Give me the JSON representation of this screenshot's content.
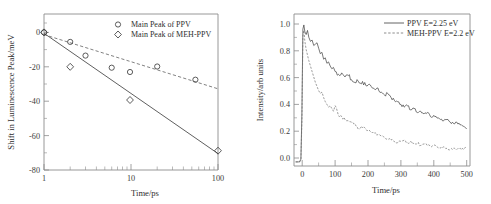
{
  "figure": {
    "background": "#ffffff",
    "panel_count": 2
  },
  "chart_data": [
    {
      "id": "left",
      "type": "scatter",
      "title": "",
      "xlabel": "Time/ps",
      "ylabel": "Shift in Luminescence Peak/meV",
      "xscale": "log",
      "yscale": "linear",
      "xlim": [
        1,
        100
      ],
      "ylim": [
        -80,
        5
      ],
      "xticks": [
        1,
        10,
        100
      ],
      "xticklabels": [
        "1",
        "10",
        "100"
      ],
      "yticks": [
        0,
        -20,
        -40,
        -60,
        -80
      ],
      "yticklabels": [
        "0",
        "-20",
        "-40",
        "-60",
        "-80"
      ],
      "grid": false,
      "legend_position": "top-right",
      "series": [
        {
          "name": "Main Peak of PPV",
          "marker": "circle",
          "linestyle": "dashed",
          "color": "#3f3f3f",
          "x": [
            1,
            2,
            3,
            6,
            11,
            20,
            47
          ],
          "y": [
            0,
            -5.5,
            -13.5,
            -20.5,
            -23.0,
            -19.8,
            -27.5
          ],
          "fit_x": [
            1,
            100
          ],
          "fit_y": [
            -1.5,
            -33.0
          ]
        },
        {
          "name": "Main Peak of MEH-PPV",
          "marker": "diamond",
          "linestyle": "solid",
          "color": "#3f3f3f",
          "x": [
            1,
            2,
            11,
            100
          ],
          "y": [
            0,
            -20.0,
            -39.5,
            -69.0
          ],
          "fit_x": [
            1,
            100
          ],
          "fit_y": [
            -0.5,
            -70.0
          ]
        }
      ]
    },
    {
      "id": "right",
      "type": "line",
      "title": "",
      "xlabel": "Time/ps",
      "ylabel": "Intensity/arb units",
      "xscale": "linear",
      "yscale": "linear",
      "xlim": [
        -25,
        510
      ],
      "ylim": [
        -0.03,
        1.08
      ],
      "xticks": [
        0,
        100,
        200,
        300,
        400,
        500
      ],
      "xticklabels": [
        "0",
        "100",
        "200",
        "300",
        "400",
        "500"
      ],
      "yticks": [
        0.0,
        0.2,
        0.4,
        0.6,
        0.8,
        1.0
      ],
      "yticklabels": [
        "0.0",
        "0.2",
        "0.4",
        "0.6",
        "0.8",
        "1.0"
      ],
      "grid": false,
      "legend_position": "top-right",
      "series": [
        {
          "name": "PPV E=2.25 eV",
          "linestyle": "solid",
          "color": "#3d3d3d",
          "x": [
            -20,
            -8,
            -4,
            -1,
            2,
            5,
            8,
            12,
            16,
            20,
            25,
            30,
            35,
            40,
            45,
            50,
            55,
            60,
            65,
            70,
            75,
            80,
            85,
            90,
            95,
            100,
            110,
            120,
            130,
            140,
            150,
            160,
            170,
            180,
            190,
            200,
            210,
            220,
            230,
            240,
            250,
            260,
            270,
            280,
            290,
            300,
            310,
            320,
            330,
            340,
            350,
            360,
            370,
            380,
            390,
            400,
            410,
            420,
            430,
            440,
            450,
            460,
            470,
            480,
            490,
            500
          ],
          "y": [
            0.0,
            0.0,
            0.02,
            0.35,
            0.97,
            1.0,
            0.95,
            0.93,
            0.96,
            0.91,
            0.88,
            0.89,
            0.85,
            0.86,
            0.87,
            0.83,
            0.79,
            0.8,
            0.75,
            0.76,
            0.72,
            0.73,
            0.7,
            0.68,
            0.69,
            0.66,
            0.64,
            0.65,
            0.62,
            0.63,
            0.6,
            0.58,
            0.59,
            0.57,
            0.58,
            0.56,
            0.55,
            0.53,
            0.54,
            0.51,
            0.49,
            0.5,
            0.47,
            0.45,
            0.44,
            0.42,
            0.4,
            0.41,
            0.38,
            0.39,
            0.36,
            0.37,
            0.35,
            0.36,
            0.33,
            0.34,
            0.32,
            0.31,
            0.3,
            0.31,
            0.29,
            0.28,
            0.29,
            0.27,
            0.26,
            0.24
          ]
        },
        {
          "name": "MEH-PPV E=2.2 eV",
          "linestyle": "dashed",
          "color": "#6e6e6e",
          "x": [
            -20,
            -8,
            -4,
            -1,
            2,
            5,
            8,
            12,
            16,
            20,
            25,
            30,
            35,
            40,
            45,
            50,
            55,
            60,
            65,
            70,
            75,
            80,
            85,
            90,
            95,
            100,
            110,
            120,
            130,
            140,
            150,
            160,
            170,
            180,
            190,
            200,
            210,
            220,
            230,
            240,
            250,
            260,
            270,
            280,
            290,
            300,
            310,
            320,
            330,
            340,
            350,
            360,
            370,
            380,
            390,
            400,
            410,
            420,
            430,
            440,
            450,
            460,
            470,
            480,
            490,
            500
          ],
          "y": [
            0.0,
            0.0,
            0.02,
            0.3,
            0.92,
            0.96,
            0.88,
            0.82,
            0.78,
            0.74,
            0.7,
            0.66,
            0.62,
            0.58,
            0.55,
            0.52,
            0.5,
            0.51,
            0.47,
            0.44,
            0.42,
            0.4,
            0.41,
            0.39,
            0.37,
            0.41,
            0.34,
            0.33,
            0.31,
            0.3,
            0.29,
            0.28,
            0.24,
            0.26,
            0.25,
            0.23,
            0.22,
            0.21,
            0.2,
            0.19,
            0.18,
            0.17,
            0.16,
            0.15,
            0.14,
            0.15,
            0.16,
            0.14,
            0.15,
            0.13,
            0.14,
            0.12,
            0.13,
            0.12,
            0.11,
            0.12,
            0.11,
            0.1,
            0.11,
            0.1,
            0.09,
            0.1,
            0.09,
            0.1,
            0.09,
            0.11
          ]
        }
      ]
    }
  ]
}
